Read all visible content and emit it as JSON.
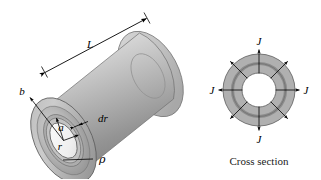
{
  "figure": {
    "background_color": "#ffffff",
    "line_color": "#000000"
  },
  "cylinder": {
    "name": "hollow-cylinder-3d",
    "labels": {
      "length": "L",
      "outer_radius": "b",
      "inner_radius": "a",
      "element_radius": "r",
      "element_thickness": "dr",
      "resistivity": "ρ"
    },
    "colors": {
      "body_light": "#d5d5d5",
      "body_mid": "#b4b4b4",
      "body_dark": "#8d8d8d",
      "face_light": "#cfcfcf",
      "face_mid": "#a9a9a9",
      "face_dark": "#8a8a8a",
      "bore": "#f4f4f4",
      "ring_dark": "#9a9a9a"
    }
  },
  "cross_section": {
    "name": "cross-section-diagram",
    "caption": "Cross section",
    "current_label": "J",
    "arrow_labels": [
      "J",
      "J",
      "J",
      "J"
    ],
    "arrow_count": 8,
    "colors": {
      "annulus": "#b0b0b0",
      "mid_ring": "#8f8f8f",
      "bore": "#ffffff",
      "outline": "#5a5a5a"
    }
  }
}
